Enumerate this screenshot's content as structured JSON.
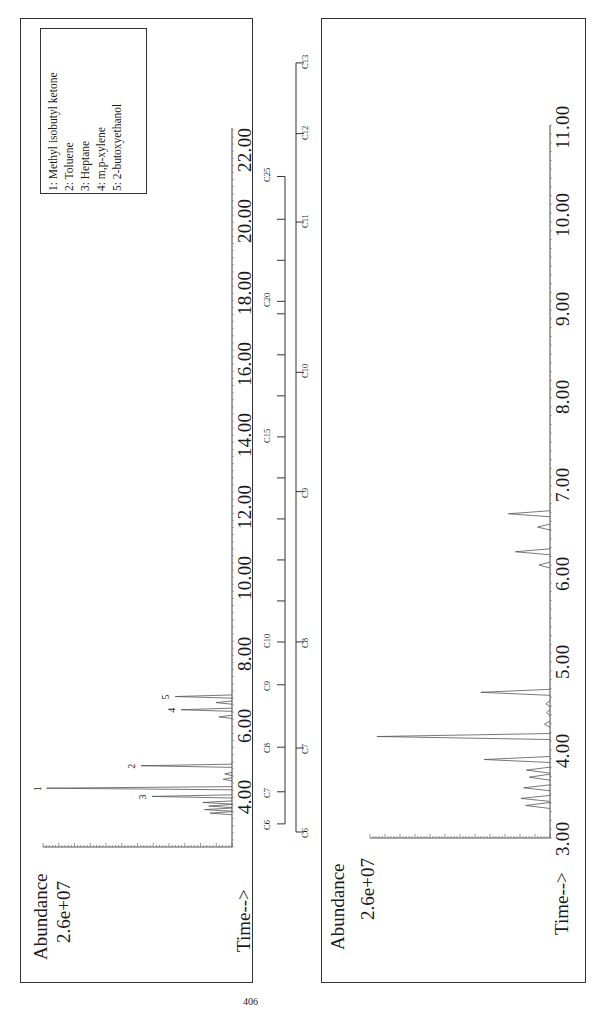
{
  "page": {
    "number": "406"
  },
  "legend": {
    "items": [
      "1: Methyl isobutyl ketone",
      "2: Toluene",
      "3: Heptane",
      "4: m,p-xylene",
      "5: 2-butoxyethanol"
    ]
  },
  "left_panel": {
    "ylabel": "Abundance",
    "yscale": "2.6e+07",
    "xlabel": "Time-->",
    "xticks": [
      "4.00",
      "6.00",
      "8.00",
      "10.00",
      "12.00",
      "14.00",
      "16.00",
      "18.00",
      "20.00",
      "22.00"
    ]
  },
  "right_panel": {
    "ylabel": "Abundance",
    "yscale": "2.6e+07",
    "xlabel": "Time-->",
    "xticks": [
      "3.00",
      "4.00",
      "5.00",
      "6.00",
      "7.00",
      "8.00",
      "9.00",
      "10.00",
      "11.00"
    ]
  },
  "carbon_scale_left": {
    "labels": [
      "C6",
      "C7",
      "C8",
      "C9",
      "C10",
      "C15",
      "C20",
      "C25"
    ]
  },
  "carbon_scale_right": {
    "labels": [
      "C6",
      "C7",
      "C8",
      "C9",
      "C10",
      "C11",
      "C12",
      "C13"
    ]
  },
  "chart_data": [
    {
      "type": "line",
      "title": "Total ion chromatogram (full range)",
      "xlabel": "Time-->",
      "ylabel": "Abundance",
      "y_full_scale": "2.6e+07",
      "xlim": [
        3.0,
        23.5
      ],
      "ylim": [
        0,
        26000000
      ],
      "orientation": "rotated -90deg (time axis vertical, increasing upward)",
      "grid": false,
      "legend_position": "top-left box",
      "peaks": [
        {
          "label": "3",
          "compound": "Heptane",
          "time": 3.82,
          "abundance": 11000000
        },
        {
          "label": "1",
          "compound": "Methyl isobutyl ketone",
          "time": 4.05,
          "abundance": 25500000
        },
        {
          "label": "2",
          "compound": "Toluene",
          "time": 4.68,
          "abundance": 12500000
        },
        {
          "label": "4",
          "compound": "m,p-xylene",
          "time": 6.25,
          "abundance": 7000000
        },
        {
          "label": "5",
          "compound": "2-butoxyethanol",
          "time": 6.62,
          "abundance": 7800000
        }
      ],
      "minor_peaks": [
        {
          "time": 3.35,
          "abundance": 3000000
        },
        {
          "time": 3.45,
          "abundance": 3800000
        },
        {
          "time": 3.55,
          "abundance": 3200000
        },
        {
          "time": 3.65,
          "abundance": 4000000
        },
        {
          "time": 4.3,
          "abundance": 1200000
        },
        {
          "time": 4.45,
          "abundance": 1000000
        },
        {
          "time": 6.05,
          "abundance": 1800000
        },
        {
          "time": 6.45,
          "abundance": 2200000
        }
      ],
      "carbon_markers": [
        {
          "label": "C6",
          "time": 3.05
        },
        {
          "label": "C7",
          "time": 3.95
        },
        {
          "label": "C8",
          "time": 5.2
        },
        {
          "label": "C9",
          "time": 6.95
        },
        {
          "label": "C10",
          "time": 8.15
        },
        {
          "label": "C15",
          "time": 13.9
        },
        {
          "label": "C20",
          "time": 17.7
        },
        {
          "label": "C25",
          "time": 21.2
        }
      ]
    },
    {
      "type": "line",
      "title": "Total ion chromatogram (expanded 3-12 min)",
      "xlabel": "Time-->",
      "ylabel": "Abundance",
      "y_full_scale": "2.6e+07",
      "xlim": [
        2.95,
        11.75
      ],
      "ylim": [
        0,
        26000000
      ],
      "orientation": "rotated -90deg (time axis vertical, increasing upward)",
      "grid": false,
      "peaks": [
        {
          "label": "3",
          "compound": "Heptane",
          "time": 3.82,
          "abundance": 9500000
        },
        {
          "label": "1",
          "compound": "Methyl isobutyl ketone",
          "time": 4.08,
          "abundance": 25000000
        },
        {
          "label": "2",
          "compound": "Toluene",
          "time": 4.58,
          "abundance": 10000000
        },
        {
          "label": "4",
          "compound": "m,p-xylene",
          "time": 6.17,
          "abundance": 5000000
        },
        {
          "label": "5",
          "compound": "2-butoxyethanol",
          "time": 6.6,
          "abundance": 6000000
        }
      ],
      "minor_peaks": [
        {
          "time": 3.3,
          "abundance": 3500000
        },
        {
          "time": 3.38,
          "abundance": 4200000
        },
        {
          "time": 3.5,
          "abundance": 3800000
        },
        {
          "time": 3.62,
          "abundance": 3000000
        },
        {
          "time": 3.7,
          "abundance": 3400000
        },
        {
          "time": 4.22,
          "abundance": 800000
        },
        {
          "time": 4.35,
          "abundance": 500000
        },
        {
          "time": 4.45,
          "abundance": 600000
        },
        {
          "time": 6.02,
          "abundance": 1600000
        },
        {
          "time": 6.45,
          "abundance": 1800000
        }
      ],
      "carbon_markers": [
        {
          "label": "C6",
          "time": 3.0
        },
        {
          "label": "C7",
          "time": 3.95
        },
        {
          "label": "C8",
          "time": 5.15
        },
        {
          "label": "C9",
          "time": 6.85
        },
        {
          "label": "C10",
          "time": 8.2
        },
        {
          "label": "C11",
          "time": 9.9
        },
        {
          "label": "C12",
          "time": 10.9
        },
        {
          "label": "C13",
          "time": 11.7
        }
      ]
    }
  ]
}
